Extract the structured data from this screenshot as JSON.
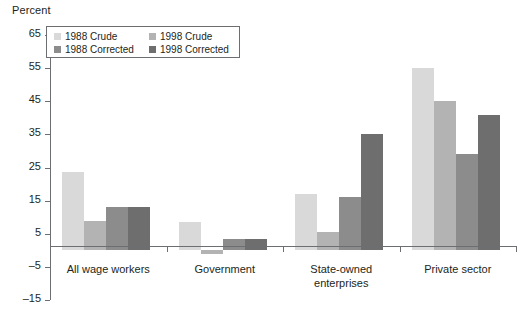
{
  "axis_title": "Percent",
  "legend": {
    "items": [
      {
        "label": "1988 Crude",
        "color": "#d9d9d9",
        "col": 0,
        "row": 0
      },
      {
        "label": "1998 Crude",
        "color": "#b3b3b3",
        "col": 1,
        "row": 0
      },
      {
        "label": "1988 Corrected",
        "color": "#8c8c8c",
        "col": 0,
        "row": 1
      },
      {
        "label": "1998 Corrected",
        "color": "#6e6e6e",
        "col": 1,
        "row": 1
      }
    ]
  },
  "chart_data": {
    "type": "bar",
    "title": "",
    "xlabel": "",
    "ylabel": "Percent",
    "ylim": [
      -15,
      65
    ],
    "yticks": [
      65,
      55,
      45,
      35,
      25,
      15,
      5,
      -5,
      -15
    ],
    "ytick_labels": [
      "65",
      "55",
      "45",
      "35",
      "25",
      "15",
      "5",
      "–5",
      "–15"
    ],
    "grid": false,
    "legend_position": "top-left",
    "categories": [
      "All wage workers",
      "Government",
      "State-owned\nenterprises",
      "Private sector"
    ],
    "series": [
      {
        "name": "1988 Crude",
        "color": "#d9d9d9",
        "values": [
          23.5,
          8.5,
          17.0,
          55.0
        ]
      },
      {
        "name": "1998 Crude",
        "color": "#b3b3b3",
        "values": [
          9.0,
          -1.0,
          5.5,
          45.0
        ]
      },
      {
        "name": "1988 Corrected",
        "color": "#8c8c8c",
        "values": [
          13.0,
          3.5,
          16.0,
          29.0
        ]
      },
      {
        "name": "1998 Corrected",
        "color": "#6e6e6e",
        "values": [
          13.0,
          3.5,
          35.0,
          41.0
        ]
      }
    ]
  }
}
